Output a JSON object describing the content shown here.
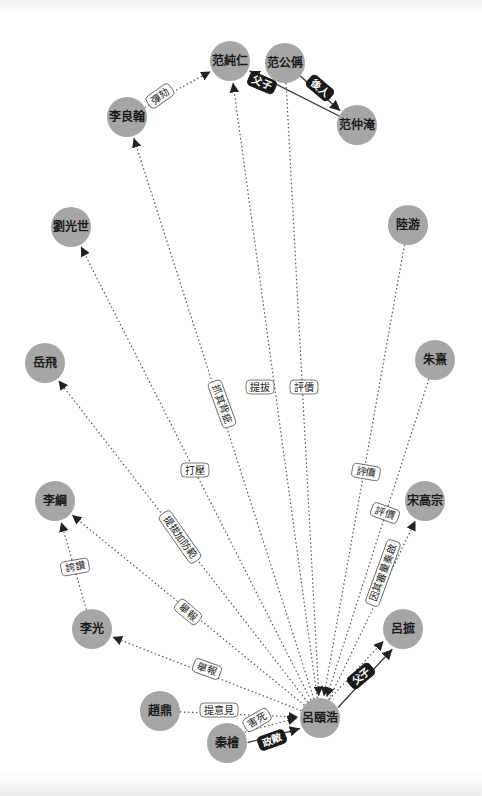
{
  "graph": {
    "center": "呂頤浩",
    "colors": {
      "node": "#a6a6a6",
      "edge": "#555555",
      "dark_label": "#1a1a1a"
    },
    "nodes": [
      {
        "id": "n0",
        "label": "范純仁",
        "x": 230,
        "y": 61
      },
      {
        "id": "n1",
        "label": "范公偁",
        "x": 285,
        "y": 63
      },
      {
        "id": "n2",
        "label": "范仲淹",
        "x": 357,
        "y": 125
      },
      {
        "id": "n3",
        "label": "李良翰",
        "x": 127,
        "y": 117
      },
      {
        "id": "n4",
        "label": "劉光世",
        "x": 71,
        "y": 227
      },
      {
        "id": "n5",
        "label": "陸游",
        "x": 408,
        "y": 225
      },
      {
        "id": "n6",
        "label": "岳飛",
        "x": 45,
        "y": 363
      },
      {
        "id": "n7",
        "label": "朱熹",
        "x": 435,
        "y": 360
      },
      {
        "id": "n8",
        "label": "李綱",
        "x": 55,
        "y": 501
      },
      {
        "id": "n9",
        "label": "宋高宗",
        "x": 425,
        "y": 501
      },
      {
        "id": "n10",
        "label": "李光",
        "x": 92,
        "y": 629
      },
      {
        "id": "n11",
        "label": "呂摭",
        "x": 403,
        "y": 629
      },
      {
        "id": "n12",
        "label": "趙鼎",
        "x": 160,
        "y": 711
      },
      {
        "id": "n13",
        "label": "呂頤浩",
        "x": 320,
        "y": 718
      },
      {
        "id": "n14",
        "label": "秦檜",
        "x": 227,
        "y": 743
      }
    ],
    "edges": [
      {
        "from": "n2",
        "to": "n0",
        "label": "父子",
        "style": "solid",
        "lx": 262,
        "ly": 83,
        "angle": 23
      },
      {
        "from": "n1",
        "to": "n2",
        "label": "後人",
        "style": "solid",
        "lx": 320,
        "ly": 88,
        "angle": 40
      },
      {
        "from": "n3",
        "to": "n0",
        "label": "彈劾",
        "style": "dotted",
        "lx": 160,
        "ly": 96,
        "angle": -35
      },
      {
        "from": "n13",
        "to": "n3",
        "label": "抓其背疵",
        "style": "dotted",
        "lx": 222,
        "ly": 404,
        "angle": 70
      },
      {
        "from": "n13",
        "to": "n0",
        "label": "提拔",
        "style": "dotted",
        "lx": 260,
        "ly": 387,
        "angle": 0
      },
      {
        "from": "n1",
        "to": "n13",
        "label": "評價",
        "style": "dotted",
        "lx": 304,
        "ly": 387,
        "angle": 0
      },
      {
        "from": "n13",
        "to": "n4",
        "label": "打壓",
        "style": "dotted",
        "lx": 195,
        "ly": 470,
        "angle": 0
      },
      {
        "from": "n5",
        "to": "n13",
        "label": "評價",
        "style": "dotted",
        "lx": 366,
        "ly": 472,
        "angle": 10
      },
      {
        "from": "n13",
        "to": "n6",
        "label": "提拔加防範",
        "style": "dotted",
        "lx": 180,
        "ly": 537,
        "angle": 55
      },
      {
        "from": "n7",
        "to": "n13",
        "label": "評價",
        "style": "dotted",
        "lx": 385,
        "ly": 513,
        "angle": 20
      },
      {
        "from": "n13",
        "to": "n9",
        "label": "因其審量奏啟",
        "style": "dotted",
        "lx": 383,
        "ly": 573,
        "angle": -70
      },
      {
        "from": "n10",
        "to": "n8",
        "label": "誇讚",
        "style": "dotted",
        "lx": 75,
        "ly": 567,
        "angle": -10
      },
      {
        "from": "n13",
        "to": "n8",
        "label": "舉報",
        "style": "dotted",
        "lx": 188,
        "ly": 612,
        "angle": 40
      },
      {
        "from": "n13",
        "to": "n10",
        "label": "舉報",
        "style": "dotted",
        "lx": 207,
        "ly": 669,
        "angle": 20
      },
      {
        "from": "n13",
        "to": "n11",
        "label": "",
        "style": "dotted",
        "lx": 0,
        "ly": 0,
        "angle": 0
      },
      {
        "from": "n13",
        "to": "n11",
        "label": "父子",
        "style": "solid",
        "lx": 361,
        "ly": 676,
        "angle": -40
      },
      {
        "from": "n12",
        "to": "n13",
        "label": "提意見",
        "style": "dotted",
        "lx": 219,
        "ly": 710,
        "angle": 0
      },
      {
        "from": "n14",
        "to": "n13",
        "label": "害死",
        "style": "dotted",
        "lx": 257,
        "ly": 720,
        "angle": -30
      },
      {
        "from": "n14",
        "to": "n13",
        "label": "政敵",
        "style": "solid",
        "lx": 272,
        "ly": 740,
        "angle": -20
      }
    ]
  }
}
